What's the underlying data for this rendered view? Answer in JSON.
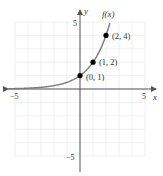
{
  "heading": "Figure",
  "chart_data": {
    "type": "line",
    "title": "",
    "function_label": "f(x)",
    "xlabel": "x",
    "ylabel": "y",
    "xlim": [
      -5,
      5
    ],
    "ylim": [
      -5,
      5
    ],
    "x_ticks": [
      "-5",
      "5"
    ],
    "y_ticks": [
      "5",
      "-5"
    ],
    "grid": true,
    "series": [
      {
        "name": "f(x) = 2^x",
        "x": [
          -5,
          -4,
          -3,
          -2,
          -1,
          0,
          1,
          2,
          2.3
        ],
        "y": [
          0.03125,
          0.0625,
          0.125,
          0.25,
          0.5,
          1,
          2,
          4,
          4.92
        ]
      }
    ],
    "points": [
      {
        "x": 0,
        "y": 1,
        "label": "(0, 1)"
      },
      {
        "x": 1,
        "y": 2,
        "label": "(1, 2)"
      },
      {
        "x": 2,
        "y": 4,
        "label": "(2, 4)"
      }
    ],
    "colors": {
      "curve": "#7a7a7a",
      "axis": "#555555",
      "grid": "#e6e6e6",
      "point": "#000000"
    }
  }
}
